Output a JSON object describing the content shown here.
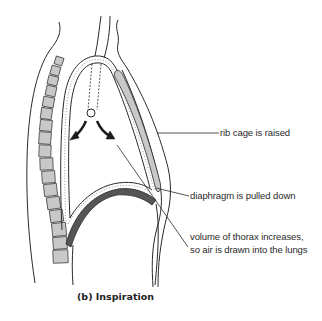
{
  "diagram": {
    "caption": "(b) Inspiration",
    "labels": {
      "rib_cage": "rib cage is raised",
      "diaphragm": "diaphragm is pulled down",
      "volume_line1": "volume of thorax increases,",
      "volume_line2": "so air is drawn into the lungs"
    },
    "parts": [
      "back-outline",
      "spine",
      "pleural-membranes",
      "trachea",
      "bronchi-arrows",
      "rib-cage",
      "diaphragm",
      "chest-wall"
    ],
    "colors": {
      "line": "#2a2a2a",
      "bone_fill": "#c8c8c8",
      "diaphragm_fill": "#555555",
      "background": "#ffffff"
    }
  }
}
